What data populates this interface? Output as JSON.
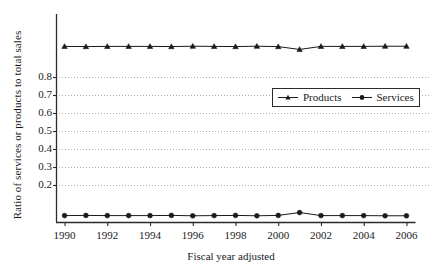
{
  "chart_data": {
    "type": "line",
    "title": "",
    "xlabel": "Fiscal year adjusted",
    "ylabel": "Ratio of services or products to total sales",
    "x": [
      1990,
      1991,
      1992,
      1993,
      1994,
      1995,
      1996,
      1997,
      1998,
      1999,
      2000,
      2001,
      2002,
      2003,
      2004,
      2005,
      2006
    ],
    "xtick_labels": [
      "1990",
      "1992",
      "1994",
      "1996",
      "1998",
      "2000",
      "2002",
      "2004",
      "2006"
    ],
    "xtick_values": [
      1990,
      1992,
      1994,
      1996,
      1998,
      2000,
      2002,
      2004,
      2006
    ],
    "ytick_labels": [
      "0.2",
      "0.3",
      "0.4",
      "0.5",
      "0.6",
      "0.7",
      "0.8"
    ],
    "ytick_values": [
      0.2,
      0.3,
      0.4,
      0.5,
      0.6,
      0.7,
      0.8
    ],
    "xlim": [
      1989.6,
      2006.4
    ],
    "ylim": [
      0.0,
      1.0
    ],
    "grid": "horizontal-dotted",
    "legend_position": "center-right",
    "series": [
      {
        "name": "Products",
        "marker": "triangle",
        "color": "#1a1a1a",
        "values": [
          0.97,
          0.969,
          0.97,
          0.97,
          0.97,
          0.969,
          0.971,
          0.97,
          0.969,
          0.971,
          0.969,
          0.953,
          0.97,
          0.97,
          0.97,
          0.971,
          0.971
        ]
      },
      {
        "name": "Services",
        "marker": "circle",
        "color": "#1a1a1a",
        "values": [
          0.03,
          0.031,
          0.03,
          0.03,
          0.03,
          0.031,
          0.029,
          0.03,
          0.031,
          0.029,
          0.031,
          0.047,
          0.03,
          0.03,
          0.03,
          0.029,
          0.029
        ]
      }
    ]
  },
  "legend": {
    "items": [
      {
        "label": "Products",
        "marker": "triangle"
      },
      {
        "label": "Services",
        "marker": "circle"
      }
    ]
  },
  "axes": {
    "y_title": "Ratio of services or products to total sales",
    "x_title": "Fiscal year adjusted"
  }
}
